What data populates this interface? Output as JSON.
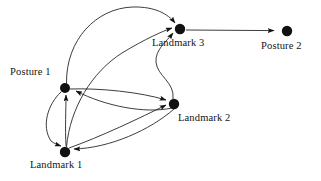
{
  "diagram": {
    "background_color": "#ffffff",
    "node_color": "#111111",
    "edge_color": "#1a1a1a",
    "nodes": [
      {
        "id": "posture1",
        "label": "Posture 1",
        "x": 65,
        "y": 88,
        "r": 5.0,
        "label_x": 10,
        "label_y": 66
      },
      {
        "id": "landmark1",
        "label": "Landmark 1",
        "x": 65,
        "y": 152,
        "r": 5.2,
        "label_x": 30,
        "label_y": 159
      },
      {
        "id": "landmark2",
        "label": "Landmark 2",
        "x": 174,
        "y": 104,
        "r": 5.2,
        "label_x": 178,
        "label_y": 112
      },
      {
        "id": "landmark3",
        "label": "Landmark 3",
        "x": 180,
        "y": 29,
        "r": 5.2,
        "label_x": 152,
        "label_y": 37
      },
      {
        "id": "posture2",
        "label": "Posture 2",
        "x": 287,
        "y": 31,
        "r": 5.2,
        "label_x": 261,
        "label_y": 40
      }
    ],
    "edges": [
      {
        "from": "landmark3",
        "to": "posture2",
        "shape": "straight",
        "arrow": "to"
      },
      {
        "from": "posture1",
        "to": "landmark3",
        "shape": "arc-over-top",
        "arrow": "to"
      },
      {
        "from": "landmark1",
        "to": "landmark3",
        "shape": "arc-long-diagonal",
        "arrow": "to"
      },
      {
        "from": "landmark2",
        "to": "landmark3",
        "shape": "s-curve",
        "arrow": "to"
      },
      {
        "from": "posture1",
        "to": "landmark1",
        "shape": "curve-left-bow",
        "arrow": "to"
      },
      {
        "from": "landmark1",
        "to": "posture1",
        "shape": "curve-right-bow",
        "arrow": "to"
      },
      {
        "from": "posture1",
        "to": "landmark2",
        "shape": "curve-upper",
        "arrow": "to"
      },
      {
        "from": "landmark2",
        "to": "posture1",
        "shape": "curve-lower",
        "arrow": "to"
      },
      {
        "from": "landmark1",
        "to": "landmark2",
        "shape": "curve-upper",
        "arrow": "to"
      },
      {
        "from": "landmark2",
        "to": "landmark1",
        "shape": "curve-lower",
        "arrow": "to"
      }
    ]
  }
}
